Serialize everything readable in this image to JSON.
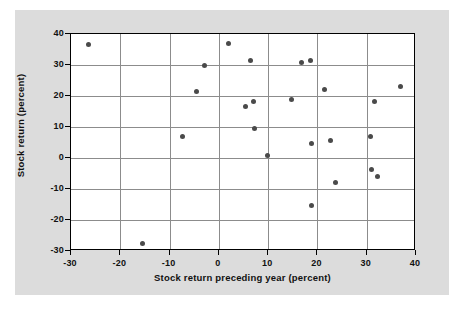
{
  "figure": {
    "background_color": "#dcdcdc",
    "plot_background_color": "#ffffff",
    "grid_color": "#8c8c8c",
    "marker_color": "#4a4a4a",
    "axis_color": "#000000"
  },
  "chart_data": {
    "type": "scatter",
    "title": "",
    "xlabel": "Stock return preceding year (percent)",
    "ylabel": "Stock return (percent)",
    "xlim": [
      -30,
      40
    ],
    "ylim": [
      -30,
      40
    ],
    "xticks": [
      -30,
      -20,
      -10,
      0,
      10,
      20,
      30,
      40
    ],
    "yticks": [
      -30,
      -20,
      -10,
      0,
      10,
      20,
      30,
      40
    ],
    "xtick_labels": [
      "-30",
      "-20",
      "-10",
      "0",
      "10",
      "20",
      "30",
      "40"
    ],
    "ytick_labels": [
      "-30",
      "-20",
      "-10",
      "0",
      "10",
      "20",
      "30",
      "40"
    ],
    "grid": true,
    "legend": null,
    "marker": "circle",
    "points": [
      {
        "x": -26.5,
        "y": 36.7
      },
      {
        "x": -15.4,
        "y": -27.6
      },
      {
        "x": -7.4,
        "y": 6.9
      },
      {
        "x": -4.6,
        "y": 21.3
      },
      {
        "x": -2.9,
        "y": 29.9
      },
      {
        "x": 1.9,
        "y": 36.8
      },
      {
        "x": 5.4,
        "y": 16.5
      },
      {
        "x": 6.4,
        "y": 31.4
      },
      {
        "x": 7.1,
        "y": 18.3
      },
      {
        "x": 7.3,
        "y": 9.6
      },
      {
        "x": 9.9,
        "y": 0.9
      },
      {
        "x": 14.7,
        "y": 18.9
      },
      {
        "x": 16.8,
        "y": 30.8
      },
      {
        "x": 18.5,
        "y": 31.6
      },
      {
        "x": 18.7,
        "y": 4.6
      },
      {
        "x": 18.8,
        "y": -15.3
      },
      {
        "x": 21.5,
        "y": 22.2
      },
      {
        "x": 22.6,
        "y": 5.6
      },
      {
        "x": 23.7,
        "y": -7.9
      },
      {
        "x": 30.7,
        "y": 6.9
      },
      {
        "x": 30.9,
        "y": -3.8
      },
      {
        "x": 31.6,
        "y": 18.3
      },
      {
        "x": 32.1,
        "y": -6.1
      },
      {
        "x": 36.8,
        "y": 23.1
      }
    ]
  }
}
